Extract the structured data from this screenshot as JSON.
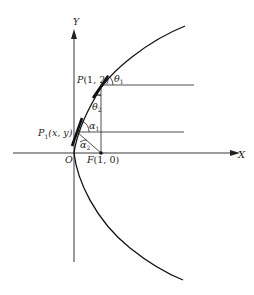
{
  "diagram": {
    "type": "parabola-reflection",
    "axes": {
      "x_label": "X",
      "y_label": "Y",
      "origin_label": "O"
    },
    "points": {
      "P": {
        "name": "P",
        "coords": "(1, 2)"
      },
      "P1": {
        "name": "P",
        "subscript": "1",
        "coords": "(x, y)"
      },
      "F": {
        "name": "F",
        "coords": "(1, 0)"
      }
    },
    "angles": {
      "theta1": {
        "symbol": "θ",
        "subscript": "1"
      },
      "theta2": {
        "symbol": "θ",
        "subscript": "2"
      },
      "alpha1": {
        "symbol": "α",
        "subscript": "1"
      },
      "alpha2": {
        "symbol": "α",
        "subscript": "2"
      }
    },
    "colors": {
      "ink": "#111111",
      "background": "#ffffff"
    }
  }
}
